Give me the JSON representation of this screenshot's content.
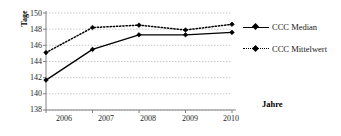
{
  "chart_data": {
    "type": "line",
    "title": "",
    "xlabel": "Jahre",
    "ylabel": "Tage",
    "categories": [
      "2006",
      "2007",
      "2008",
      "2009",
      "2010"
    ],
    "x": [
      2006,
      2007,
      2008,
      2009,
      2010
    ],
    "ylim": [
      138,
      150
    ],
    "yticks": [
      138,
      140,
      142,
      144,
      146,
      148,
      150
    ],
    "ytick_labels": [
      "138",
      "140",
      "142",
      "144",
      "146",
      "148",
      "150"
    ],
    "grid": "horizontal-dashed",
    "legend_position": "right",
    "series": [
      {
        "name": "CCC Median",
        "values": [
          141.7,
          145.5,
          147.3,
          147.3,
          147.6
        ],
        "line_style": "solid",
        "marker": "diamond",
        "color": "#000000"
      },
      {
        "name": "CCC Mittelwert",
        "values": [
          145.1,
          148.2,
          148.5,
          147.9,
          148.6
        ],
        "line_style": "dotted",
        "marker": "diamond",
        "color": "#000000"
      }
    ]
  },
  "axes": {
    "y_title": "Tage",
    "x_title": "Jahre"
  },
  "legend": {
    "items": [
      {
        "label": "CCC Median"
      },
      {
        "label": "CCC Mittelwert"
      }
    ]
  },
  "colors": {
    "ink": "#000000",
    "grid": "#b3b3b3",
    "axis": "#808080",
    "background": "#ffffff"
  }
}
